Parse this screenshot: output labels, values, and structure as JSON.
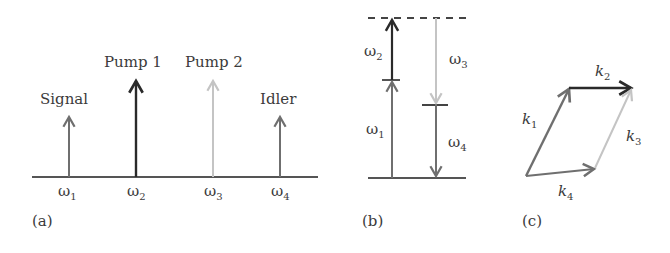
{
  "panel_a": {
    "label": "(a)",
    "beams": [
      {
        "name": "Signal",
        "freq": "ω",
        "sub": "1",
        "color": "#6f6f6f"
      },
      {
        "name": "Pump 1",
        "freq": "ω",
        "sub": "2",
        "color": "#2a2a2a"
      },
      {
        "name": "Pump 2",
        "freq": "ω",
        "sub": "3",
        "color": "#c4c4c4"
      },
      {
        "name": "Idler",
        "freq": "ω",
        "sub": "4",
        "color": "#6f6f6f"
      }
    ]
  },
  "panel_b": {
    "label": "(b)",
    "transitions": [
      {
        "freq": "ω",
        "sub": "1",
        "direction": "up"
      },
      {
        "freq": "ω",
        "sub": "2",
        "direction": "up"
      },
      {
        "freq": "ω",
        "sub": "3",
        "direction": "down"
      },
      {
        "freq": "ω",
        "sub": "4",
        "direction": "down"
      }
    ]
  },
  "panel_c": {
    "label": "(c)",
    "vectors": [
      {
        "sym": "k",
        "sub": "1"
      },
      {
        "sym": "k",
        "sub": "2"
      },
      {
        "sym": "k",
        "sub": "3"
      },
      {
        "sym": "k",
        "sub": "4"
      }
    ]
  }
}
